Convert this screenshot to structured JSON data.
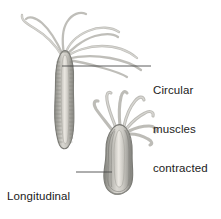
{
  "figure": {
    "type": "biological-diagram",
    "background_color": "#ffffff",
    "body_color": "#9a9a93",
    "body_light": "#d8d6d0",
    "outline_color": "#7c7c77",
    "tentacle_color": "#bdbcb7",
    "leader_line_color": "#4a4a4a",
    "text_color": "#1b1b1b"
  },
  "labels": {
    "circular": {
      "line1": "Circular",
      "line2": "muscles",
      "line3": "contracted"
    },
    "longitudinal": {
      "line1": "Longitudinal",
      "line2": "muscles",
      "line3": "contracted"
    }
  },
  "organisms": [
    {
      "name": "elongated-hydra",
      "state": "circular muscles contracted",
      "description": "tall slender hydra with long trailing tentacles"
    },
    {
      "name": "contracted-hydra",
      "state": "longitudinal muscles contracted",
      "description": "short squat hydra with short curled tentacles"
    }
  ]
}
